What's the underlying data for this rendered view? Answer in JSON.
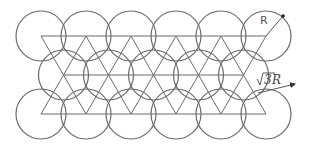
{
  "diagram": {
    "radius_px": 25,
    "spacing_px": 45,
    "row_height_px": 39,
    "rows": [
      {
        "name": "top",
        "y": 36,
        "centers_x": [
          41,
          86,
          131,
          176,
          221,
          266
        ]
      },
      {
        "name": "middle",
        "y": 75,
        "centers_x": [
          63.5,
          108.5,
          153.5,
          198.5,
          243.5
        ]
      },
      {
        "name": "bottom",
        "y": 114,
        "centers_x": [
          41,
          86,
          131,
          176,
          221,
          266
        ]
      }
    ],
    "labels": {
      "radius": "R",
      "distance": "√3R",
      "distance_radicand": "3",
      "distance_suffix": "R"
    },
    "radius_line": {
      "x1": 266,
      "y1": 36,
      "x2": 283,
      "y2": 16
    },
    "distance_arrow": {
      "x1": 258,
      "y1": 93,
      "x2": 295,
      "y2": 84
    },
    "colors": {
      "stroke": "#6b6b6b",
      "text": "#555555",
      "background": "#ffffff"
    }
  }
}
